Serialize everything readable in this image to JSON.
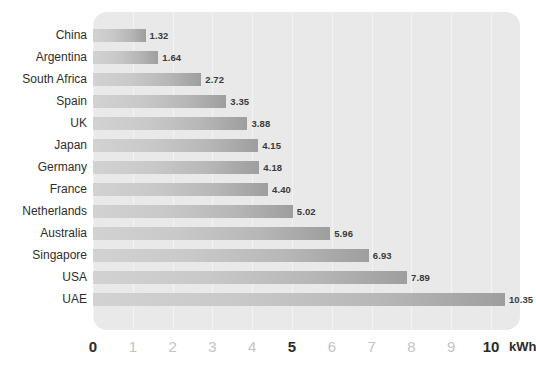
{
  "chart_data": {
    "type": "bar",
    "orientation": "horizontal",
    "title": "",
    "subtitle": "",
    "xlabel": "kWh",
    "ylabel": "",
    "xlim": [
      0,
      10.8
    ],
    "grid": true,
    "legend": null,
    "categories": [
      "China",
      "Argentina",
      "South Africa",
      "Spain",
      "UK",
      "Japan",
      "Germany",
      "France",
      "Netherlands",
      "Australia",
      "Singapore",
      "USA",
      "UAE"
    ],
    "values": [
      1.32,
      1.64,
      2.72,
      3.35,
      3.88,
      4.15,
      4.18,
      4.4,
      5.02,
      5.96,
      6.93,
      7.89,
      10.35
    ],
    "value_labels": [
      "1.32",
      "1.64",
      "2.72",
      "3.35",
      "3.88",
      "4.15",
      "4.18",
      "4.40",
      "5.02",
      "5.96",
      "6.93",
      "7.89",
      "10.35"
    ],
    "x_ticks": [
      0,
      1,
      2,
      3,
      4,
      5,
      6,
      7,
      8,
      9,
      10
    ],
    "x_tick_labels": [
      "0",
      "1",
      "2",
      "3",
      "4",
      "5",
      "6",
      "7",
      "8",
      "9",
      "10"
    ],
    "x_tick_emphasis": [
      "major",
      "minor",
      "minor",
      "minor",
      "minor",
      "major",
      "minor",
      "minor",
      "minor",
      "minor",
      "major"
    ],
    "unit": "kWh",
    "colors": {
      "plot_background": "#e9e9e9",
      "gridline": "#f3f3f3",
      "bar_gradient_start": "#d2d2d2",
      "bar_gradient_end": "#9e9e9e",
      "value_text": "#3b3b3b",
      "category_text": "#2e2e2e",
      "tick_major": "#2b2b2b",
      "tick_minor": "#c4c4c4",
      "page_background": "#ffffff"
    }
  }
}
